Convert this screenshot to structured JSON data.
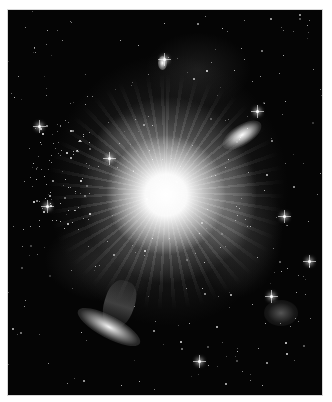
{
  "image": {
    "subject": "Grayscale astronomical image of a bright galaxy core with radiating light rays, surrounding nebulosity, a star cluster on the left, an elongated galaxy at upper right and a tilted disk galaxy at lower left",
    "alt_text": "Deep-space nebula with bright central core",
    "palette": {
      "background": "#050505",
      "core": "#ffffff",
      "nebula": "#9a9a9a",
      "border": "#d8d8d8",
      "page": "#ffffff"
    },
    "frame": {
      "left": 8,
      "top": 10,
      "width": 314,
      "height": 385
    },
    "features": [
      {
        "name": "bright-core",
        "x": 158,
        "y": 185
      },
      {
        "name": "galaxy-upper-right",
        "x": 234,
        "y": 125
      },
      {
        "name": "galaxy-lower-left",
        "x": 101,
        "y": 317
      },
      {
        "name": "small-galaxy-top",
        "x": 154,
        "y": 53
      },
      {
        "name": "star-cluster-left",
        "x": 45,
        "y": 175
      },
      {
        "name": "faint-cloud-lower-right",
        "x": 273,
        "y": 303
      }
    ]
  }
}
